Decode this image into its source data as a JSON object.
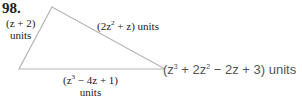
{
  "problem": {
    "number": "98."
  },
  "triangle": {
    "vertices": [
      [
        52,
        7
      ],
      [
        19,
        69
      ],
      [
        165,
        69
      ]
    ],
    "stroke_color": "#b5b5b5",
    "sides": {
      "left": {
        "expr_pre": "(z + 2)",
        "unit": "units"
      },
      "top": {
        "expr_pre": "(2z",
        "exp": "2",
        "expr_post": " + z) units"
      },
      "bottom": {
        "expr_pre": "(z",
        "exp": "3",
        "expr_post": " − 4z + 1)",
        "unit": "units"
      },
      "perimeter": {
        "expr_pre": "(z",
        "exp1": "3",
        "mid": " + 2z",
        "exp2": "2",
        "expr_post": " − 2z + 3) units"
      }
    }
  }
}
